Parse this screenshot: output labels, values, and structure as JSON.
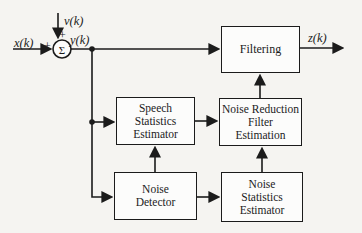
{
  "diagram": {
    "background": "#f5f4f1",
    "line_color": "#1b1b1b",
    "signals": {
      "input": "x(k)",
      "noise": "v(k)",
      "noisy": "y(k)",
      "output": "z(k)",
      "plus_left": "+",
      "plus_top": "+",
      "sum_symbol": "Σ"
    },
    "blocks": {
      "filtering": {
        "label": "Filtering"
      },
      "speech_statistics_estimator": {
        "label": "Speech\nStatistics\nEstimator"
      },
      "noise_reduction_filter_estimation": {
        "label": "Noise Reduction\nFilter\nEstimation"
      },
      "noise_detector": {
        "label": "Noise\nDetector"
      },
      "noise_statistics_estimator": {
        "label": "Noise\nStatistics\nEstimator"
      }
    }
  }
}
